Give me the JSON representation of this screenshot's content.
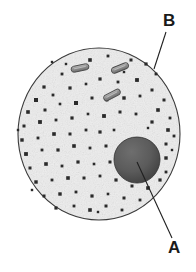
{
  "figure": {
    "background_color": "#ffffff",
    "width": 196,
    "height": 272
  },
  "cell": {
    "name": "animal-cell",
    "membrane_color": "#3a3a3a",
    "cytoplasm_color": "#f2f2f2",
    "center_x": 99,
    "center_y": 134,
    "radius_x": 81,
    "radius_y": 86
  },
  "nucleus": {
    "name": "nucleus",
    "fill_color": "#5a5a5a",
    "edge_color": "#2b2b2b",
    "center_x": 137,
    "center_y": 160,
    "radius": 23
  },
  "organelles": [
    {
      "name": "rod-organelle-1",
      "x": 80,
      "y": 68,
      "length": 18,
      "thickness": 6,
      "angle": -12,
      "fill_color": "#9a9a9a"
    },
    {
      "name": "rod-organelle-2",
      "x": 120,
      "y": 68,
      "length": 18,
      "thickness": 6,
      "angle": -22,
      "fill_color": "#9a9a9a"
    },
    {
      "name": "rod-organelle-3",
      "x": 112,
      "y": 95,
      "length": 18,
      "thickness": 6,
      "angle": -28,
      "fill_color": "#9a9a9a"
    }
  ],
  "labels": [
    {
      "id": "label-a",
      "text": "A",
      "text_x": 168,
      "text_y": 253,
      "leader_from_x": 137,
      "leader_from_y": 162,
      "leader_to_x": 172,
      "leader_to_y": 238,
      "refers_to": "nucleus"
    },
    {
      "id": "label-b",
      "text": "B",
      "text_x": 163,
      "text_y": 26,
      "leader_from_x": 166,
      "leader_from_y": 32,
      "leader_to_x": 154,
      "leader_to_y": 69,
      "refers_to": "cell-membrane"
    }
  ],
  "granules": {
    "name": "cytoplasm-granules",
    "color": "#2a2a2a",
    "points": [
      [
        44,
        87,
        1.6
      ],
      [
        62,
        74,
        1.4
      ],
      [
        90,
        60,
        1.8
      ],
      [
        108,
        56,
        1.4
      ],
      [
        131,
        60,
        1.5
      ],
      [
        146,
        64,
        1.6
      ],
      [
        156,
        74,
        1.4
      ],
      [
        36,
        100,
        2.0
      ],
      [
        53,
        95,
        1.4
      ],
      [
        70,
        88,
        1.6
      ],
      [
        86,
        84,
        1.3
      ],
      [
        100,
        79,
        1.6
      ],
      [
        118,
        82,
        1.4
      ],
      [
        137,
        80,
        1.9
      ],
      [
        152,
        90,
        1.5
      ],
      [
        164,
        100,
        1.5
      ],
      [
        28,
        112,
        1.8
      ],
      [
        45,
        110,
        1.5
      ],
      [
        60,
        104,
        1.3
      ],
      [
        76,
        103,
        2.0
      ],
      [
        92,
        98,
        1.5
      ],
      [
        107,
        100,
        1.4
      ],
      [
        124,
        98,
        1.7
      ],
      [
        140,
        96,
        1.4
      ],
      [
        158,
        110,
        1.8
      ],
      [
        170,
        118,
        1.4
      ],
      [
        24,
        126,
        1.5
      ],
      [
        40,
        122,
        1.9
      ],
      [
        56,
        120,
        1.4
      ],
      [
        72,
        118,
        1.6
      ],
      [
        88,
        114,
        1.3
      ],
      [
        104,
        116,
        1.9
      ],
      [
        120,
        112,
        1.5
      ],
      [
        136,
        114,
        1.4
      ],
      [
        152,
        122,
        1.6
      ],
      [
        168,
        130,
        1.8
      ],
      [
        22,
        140,
        1.7
      ],
      [
        38,
        138,
        1.4
      ],
      [
        54,
        134,
        1.8
      ],
      [
        70,
        134,
        1.5
      ],
      [
        86,
        130,
        1.4
      ],
      [
        100,
        132,
        1.6
      ],
      [
        114,
        130,
        1.3
      ],
      [
        166,
        144,
        1.5
      ],
      [
        174,
        136,
        1.4
      ],
      [
        26,
        154,
        1.9
      ],
      [
        42,
        150,
        1.4
      ],
      [
        58,
        150,
        1.6
      ],
      [
        74,
        146,
        1.8
      ],
      [
        90,
        148,
        1.4
      ],
      [
        106,
        146,
        1.5
      ],
      [
        166,
        158,
        1.7
      ],
      [
        30,
        168,
        1.5
      ],
      [
        46,
        164,
        1.8
      ],
      [
        62,
        166,
        1.4
      ],
      [
        78,
        162,
        1.6
      ],
      [
        94,
        164,
        1.3
      ],
      [
        110,
        162,
        1.5
      ],
      [
        166,
        172,
        1.4
      ],
      [
        160,
        180,
        1.6
      ],
      [
        36,
        182,
        1.7
      ],
      [
        52,
        180,
        1.4
      ],
      [
        68,
        178,
        1.8
      ],
      [
        84,
        178,
        1.5
      ],
      [
        100,
        176,
        1.4
      ],
      [
        116,
        180,
        1.6
      ],
      [
        132,
        186,
        1.5
      ],
      [
        148,
        188,
        1.8
      ],
      [
        44,
        196,
        1.5
      ],
      [
        60,
        194,
        1.7
      ],
      [
        76,
        192,
        1.4
      ],
      [
        92,
        196,
        1.6
      ],
      [
        108,
        194,
        1.3
      ],
      [
        124,
        198,
        1.5
      ],
      [
        140,
        200,
        1.4
      ],
      [
        56,
        208,
        1.6
      ],
      [
        74,
        206,
        1.4
      ],
      [
        90,
        210,
        1.8
      ],
      [
        106,
        206,
        1.5
      ],
      [
        122,
        210,
        1.4
      ],
      [
        66,
        64,
        1.2
      ],
      [
        124,
        72,
        1.2
      ],
      [
        148,
        128,
        1.2
      ],
      [
        32,
        190,
        1.2
      ],
      [
        98,
        212,
        1.2
      ],
      [
        52,
        62,
        1.2
      ],
      [
        172,
        150,
        1.2
      ],
      [
        18,
        130,
        1.2
      ]
    ]
  }
}
